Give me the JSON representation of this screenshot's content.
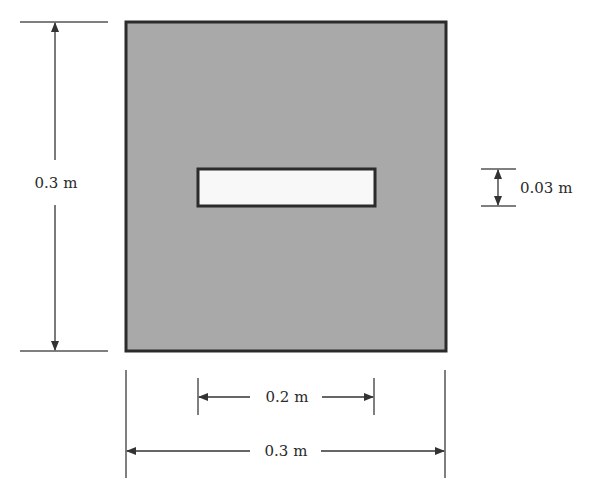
{
  "diagram": {
    "type": "cross-section-dimension-drawing",
    "colors": {
      "outer_fill": "#a9a9a9",
      "outer_stroke": "#2b2b2b",
      "inner_fill": "#f8f8f8",
      "line": "#333333",
      "background": "#ffffff"
    },
    "shapes": {
      "outer_square": {
        "x": 126,
        "y": 22,
        "width": 320,
        "height": 329
      },
      "inner_slot": {
        "x": 198,
        "y": 169,
        "width": 177,
        "height": 37
      }
    },
    "dimensions": {
      "outer_height": {
        "label": "0.3 m",
        "value": 0.3,
        "unit": "m"
      },
      "slot_height": {
        "label": "0.03 m",
        "value": 0.03,
        "unit": "m"
      },
      "slot_width": {
        "label": "0.2 m",
        "value": 0.2,
        "unit": "m"
      },
      "outer_width": {
        "label": "0.3 m",
        "value": 0.3,
        "unit": "m"
      }
    }
  }
}
